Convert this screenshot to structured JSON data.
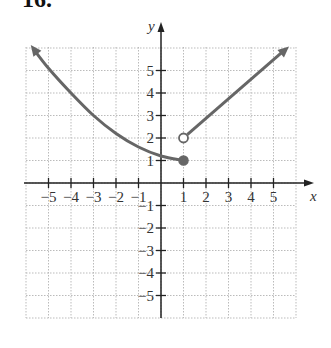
{
  "heading": "16.",
  "chart_data": {
    "type": "line",
    "title": "16.",
    "xlabel": "x",
    "ylabel": "y",
    "xlim": [
      -6,
      6
    ],
    "ylim": [
      -6,
      6
    ],
    "grid": true,
    "x_ticks": [
      -5,
      -4,
      -3,
      -2,
      -1,
      1,
      2,
      3,
      4,
      5
    ],
    "y_ticks": [
      -5,
      -4,
      -3,
      -2,
      -1,
      1,
      2,
      3,
      4,
      5
    ],
    "x_tick_labels": [
      "−5",
      "−4",
      "−3",
      "−2",
      "−1",
      "1",
      "2",
      "3",
      "4",
      "5"
    ],
    "y_tick_labels": [
      "−5",
      "−4",
      "−3",
      "−2",
      "−1",
      "1",
      "2",
      "3",
      "4",
      "5"
    ],
    "series": [
      {
        "name": "left piece (curve)",
        "description": "Decreasing curve with arrow extending up-left, ending at closed point (1,1)",
        "x": [
          -5.7,
          -5,
          -4,
          -3,
          -2,
          -1,
          0,
          1
        ],
        "y": [
          6.0,
          5.1,
          4.0,
          3.0,
          2.2,
          1.6,
          1.2,
          1.0
        ],
        "left_arrow": true,
        "endpoint": {
          "x": 1,
          "y": 1,
          "type": "closed"
        }
      },
      {
        "name": "right piece (line)",
        "description": "Increasing line starting at open point (1,2) with arrow up-right",
        "x": [
          1,
          5.6
        ],
        "y": [
          2,
          6.0
        ],
        "right_arrow": true,
        "startpoint": {
          "x": 1,
          "y": 2,
          "type": "open"
        }
      }
    ],
    "colors": {
      "curve": "#666666",
      "axes": "#222222",
      "grid": "#bbbbbb"
    }
  }
}
